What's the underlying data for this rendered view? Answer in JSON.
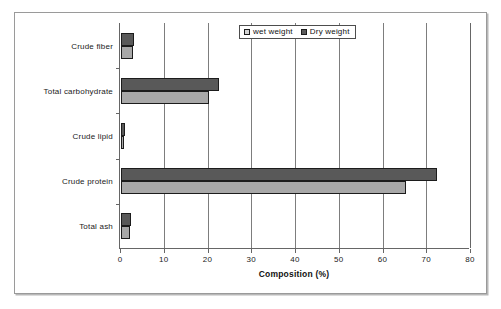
{
  "chart_data": {
    "type": "bar",
    "orientation": "horizontal",
    "title": "",
    "xlabel": "Composition (%)",
    "ylabel": "",
    "xlim": [
      0,
      80
    ],
    "xticks": [
      0,
      10,
      20,
      30,
      40,
      50,
      60,
      70,
      80
    ],
    "xtick_labels": [
      "0",
      "10",
      "20",
      "30",
      "40",
      "50",
      "60",
      "70",
      "80"
    ],
    "grid": "vertical",
    "legend_position": "top-center",
    "categories": [
      "Crude fiber",
      "Total carbohydrate",
      "Crude lipid",
      "Crude protein",
      "Total ash"
    ],
    "series": [
      {
        "name": "wet weight",
        "color": "#a8a8a8",
        "legend_swatch_color": "#d4d4d4",
        "values": [
          2.8,
          20.0,
          0.7,
          65.2,
          2.0
        ]
      },
      {
        "name": "Dry weight",
        "color": "#595959",
        "legend_swatch_color": "#5a5a5a",
        "values": [
          3.0,
          22.3,
          1.0,
          72.3,
          2.3
        ]
      }
    ]
  },
  "legend": {
    "items": [
      {
        "label": "wet weight",
        "swatch": "wet-weight-swatch"
      },
      {
        "label": "Dry weight",
        "swatch": "dry-weight-swatch"
      }
    ]
  },
  "axis": {
    "x_title": "Composition (%)"
  },
  "colors": {
    "dry_weight": "#595959",
    "wet_weight": "#a8a8a8",
    "axis": "#666666",
    "gridline": "#7d7d7d",
    "frame": "#9a9a9a",
    "background": "#ffffff"
  }
}
